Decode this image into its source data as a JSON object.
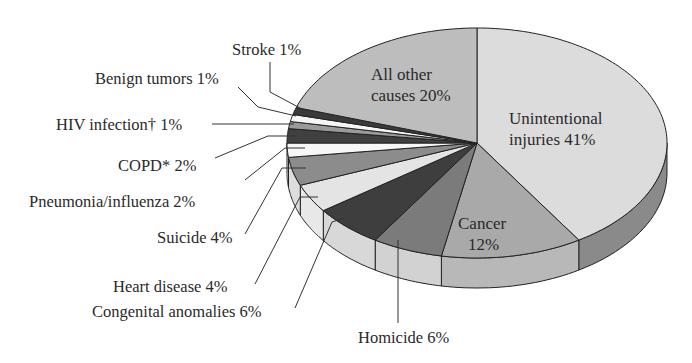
{
  "chart_data": {
    "type": "pie",
    "style": "3d-exploded-ellipse",
    "title": "",
    "start_angle": "12 o'clock",
    "direction": "clockwise",
    "slices": [
      {
        "label": "Unintentional injuries",
        "value": 41,
        "display": [
          "Unintentional",
          "injuries 41%"
        ],
        "color": "#dcdcdc",
        "side": "#8a8a8a",
        "label_pos": "inside"
      },
      {
        "label": "Cancer",
        "value": 12,
        "display": [
          "Cancer",
          "12%"
        ],
        "color": "#a9a9a9",
        "side": "#b8b8b8",
        "label_pos": "inside"
      },
      {
        "label": "Homicide",
        "value": 6,
        "display": [
          "Homicide 6%"
        ],
        "color": "#7b7b7b",
        "side": "#d2d2d2",
        "label_pos": "outside"
      },
      {
        "label": "Congenital anomalies",
        "value": 6,
        "display": [
          "Congenital anomalies 6%"
        ],
        "color": "#3e3e3e",
        "side": "#d8d8d8",
        "label_pos": "outside"
      },
      {
        "label": "Heart disease",
        "value": 4,
        "display": [
          "Heart disease 4%"
        ],
        "color": "#e4e4e4",
        "side": "#e8e8e8",
        "label_pos": "outside"
      },
      {
        "label": "Suicide",
        "value": 4,
        "display": [
          "Suicide 4%"
        ],
        "color": "#8c8c8c",
        "side": "#dddddd",
        "label_pos": "outside"
      },
      {
        "label": "Pneumonia/influenza",
        "value": 2,
        "display": [
          "Pneumonia/influenza 2%"
        ],
        "color": "#f7f7f7",
        "side": "#eeeeee",
        "label_pos": "outside"
      },
      {
        "label": "COPD*",
        "value": 2,
        "display": [
          "COPD* 2%"
        ],
        "color": "#404040",
        "side": "#e0e0e0",
        "label_pos": "outside"
      },
      {
        "label": "HIV infection†",
        "value": 1,
        "display": [
          "HIV infection† 1%"
        ],
        "color": "#9a9a9a",
        "side": "#e0e0e0",
        "label_pos": "outside"
      },
      {
        "label": "Benign tumors",
        "value": 1,
        "display": [
          "Benign tumors 1%"
        ],
        "color": "#f5f5f5",
        "side": "#e0e0e0",
        "label_pos": "outside"
      },
      {
        "label": "Stroke",
        "value": 1,
        "display": [
          "Stroke 1%"
        ],
        "color": "#3a3a3a",
        "side": "#e0e0e0",
        "label_pos": "outside"
      },
      {
        "label": "All other causes",
        "value": 20,
        "display": [
          "All other",
          "causes 20%"
        ],
        "color": "#bdbdbd",
        "side": "#bdbdbd",
        "label_pos": "inside"
      }
    ],
    "legend": null
  },
  "labels": {
    "unintentional_1": "Unintentional",
    "unintentional_2": "injuries 41%",
    "cancer_1": "Cancer",
    "cancer_2": "12%",
    "allother_1": "All other",
    "allother_2": "causes 20%",
    "homicide": "Homicide 6%",
    "congenital": "Congenital anomalies 6%",
    "heart": "Heart disease 4%",
    "suicide": "Suicide 4%",
    "pneumonia": "Pneumonia/influenza 2%",
    "copd": "COPD* 2%",
    "hiv": "HIV infection† 1%",
    "benign": "Benign tumors 1%",
    "stroke": "Stroke 1%"
  }
}
